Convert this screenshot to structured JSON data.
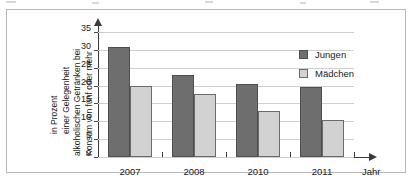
{
  "chart_data": {
    "type": "bar",
    "title": "",
    "subtitle": "",
    "xlabel": "Jahr",
    "ylabel": "Konsum von fünf oder mehr alkoholischen Getränken bei einer Gelegenheit in Prozent",
    "ylabel_lines": [
      "Konsum von fünf oder mehr",
      "alkoholischen Getränken bei",
      "einer Gelegenheit",
      "in Prozent"
    ],
    "categories": [
      "2007",
      "2008",
      "2010",
      "2011"
    ],
    "series": [
      {
        "name": "Jungen",
        "color": "#6e6e6e",
        "values": [
          30.8,
          23.1,
          20.4,
          19.7
        ]
      },
      {
        "name": "Mädchen",
        "color": "#d2d2d2",
        "values": [
          20.0,
          17.7,
          12.8,
          10.5
        ]
      }
    ],
    "ylim": [
      0,
      35
    ],
    "ytick_values": [
      0,
      5,
      10,
      15,
      20,
      25,
      30,
      35
    ],
    "ytick_labels": [
      "0",
      "5",
      "10",
      "15",
      "20",
      "25",
      "30",
      "35"
    ],
    "grid": true,
    "grid_axis": "y",
    "legend_position": "top-right",
    "axis_arrows": true,
    "unit": "Prozent"
  },
  "colors": {
    "series_jungen": "#6e6e6e",
    "series_maedchen": "#d2d2d2",
    "axis": "#3a3a3a",
    "grid": "#cfcfcf",
    "frame": "#b9b9b9",
    "text": "#1a1a1a",
    "background": "#ffffff"
  }
}
